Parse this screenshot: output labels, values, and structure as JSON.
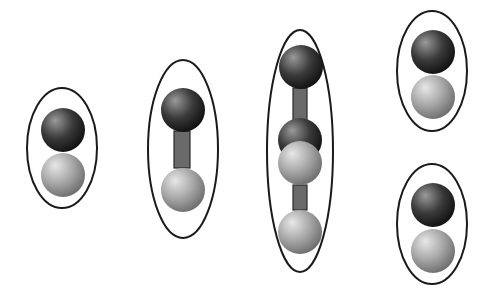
{
  "diagram": {
    "width": 488,
    "height": 298,
    "colors": {
      "background": "#ffffff",
      "outline": "#1a1a1a",
      "dark_sphere_highlight": "#9a9a9a",
      "dark_sphere_mid": "#3a3a3a",
      "dark_sphere_edge": "#111111",
      "light_sphere_highlight": "#e8e8e8",
      "light_sphere_mid": "#a8a8a8",
      "light_sphere_edge": "#6e6e6e",
      "bond_fill": "#6a6a6a",
      "bond_stroke": "#2a2a2a"
    },
    "sphere_radius": 22,
    "groups": [
      {
        "name": "pair-adjacent-1",
        "ellipse": {
          "cx": 62,
          "cy": 148,
          "rx": 35,
          "ry": 60
        },
        "spheres": [
          {
            "type": "dark",
            "cx": 63,
            "cy": 130
          },
          {
            "type": "light",
            "cx": 63,
            "cy": 175
          }
        ],
        "bonds": []
      },
      {
        "name": "pair-bonded",
        "ellipse": {
          "cx": 183,
          "cy": 149,
          "rx": 35,
          "ry": 89
        },
        "spheres": [
          {
            "type": "dark",
            "cx": 183,
            "cy": 110
          },
          {
            "type": "light",
            "cx": 183,
            "cy": 190
          }
        ],
        "bonds": [
          {
            "x": 174,
            "y": 131,
            "w": 16,
            "h": 37
          }
        ]
      },
      {
        "name": "chain-four",
        "ellipse": {
          "cx": 300,
          "cy": 151,
          "rx": 33,
          "ry": 121
        },
        "spheres": [
          {
            "type": "dark",
            "cx": 301,
            "cy": 67
          },
          {
            "type": "dark",
            "cx": 300,
            "cy": 140
          },
          {
            "type": "light",
            "cx": 300,
            "cy": 163
          },
          {
            "type": "light",
            "cx": 300,
            "cy": 232
          }
        ],
        "bonds": [
          {
            "x": 293,
            "y": 88,
            "w": 14,
            "h": 33
          },
          {
            "x": 293,
            "y": 185,
            "w": 14,
            "h": 25
          }
        ]
      },
      {
        "name": "pair-adjacent-2",
        "ellipse": {
          "cx": 432,
          "cy": 71,
          "rx": 35,
          "ry": 60
        },
        "spheres": [
          {
            "type": "dark",
            "cx": 433,
            "cy": 52
          },
          {
            "type": "light",
            "cx": 433,
            "cy": 97
          }
        ],
        "bonds": []
      },
      {
        "name": "pair-adjacent-3",
        "ellipse": {
          "cx": 432,
          "cy": 224,
          "rx": 35,
          "ry": 60
        },
        "spheres": [
          {
            "type": "dark",
            "cx": 433,
            "cy": 205
          },
          {
            "type": "light",
            "cx": 433,
            "cy": 251
          }
        ],
        "bonds": []
      }
    ]
  }
}
